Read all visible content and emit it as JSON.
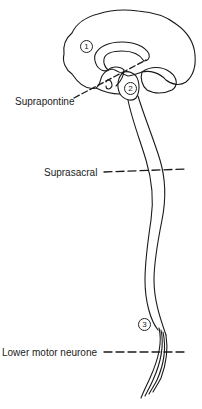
{
  "diagram": {
    "type": "anatomical-line-drawing",
    "line_color": "#1a1a1a",
    "background": "#ffffff"
  },
  "labels": {
    "suprapontine": "Suprapontine",
    "suprasacral": "Suprasacral",
    "lower_motor_neurone": "Lower motor neurone"
  },
  "markers": {
    "one": "1",
    "two": "2",
    "three": "3"
  }
}
